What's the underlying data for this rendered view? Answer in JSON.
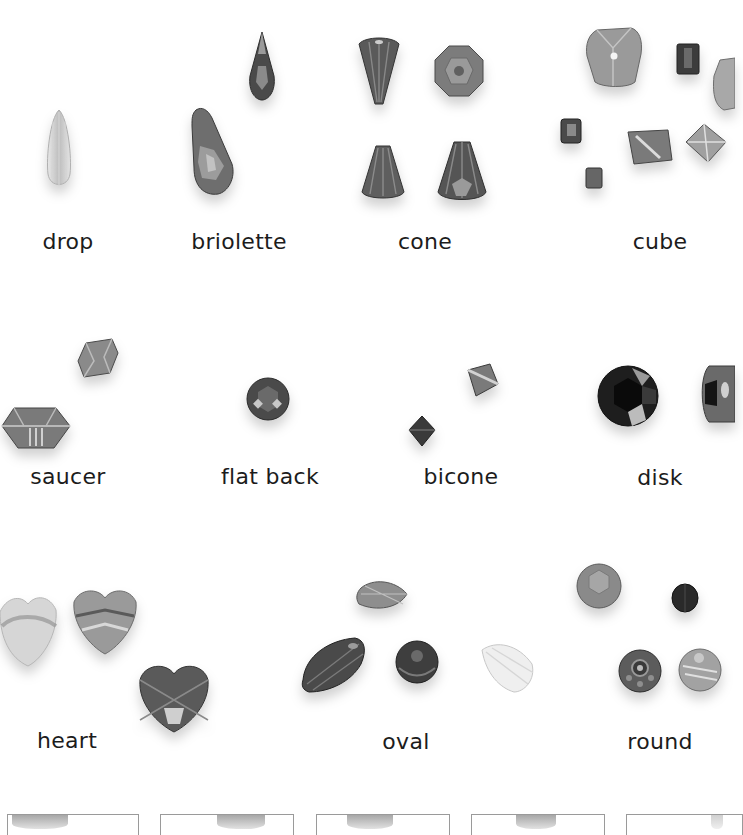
{
  "page": {
    "background": "#ffffff",
    "text_color": "#1c1c1c"
  },
  "shapes": [
    {
      "id": "drop",
      "label": "drop"
    },
    {
      "id": "briolette",
      "label": "briolette"
    },
    {
      "id": "cone",
      "label": "cone"
    },
    {
      "id": "cube",
      "label": "cube"
    },
    {
      "id": "saucer",
      "label": "saucer"
    },
    {
      "id": "flat-back",
      "label": "flat back"
    },
    {
      "id": "bicone",
      "label": "bicone"
    },
    {
      "id": "disk",
      "label": "disk"
    },
    {
      "id": "heart",
      "label": "heart"
    },
    {
      "id": "oval",
      "label": "oval"
    },
    {
      "id": "round",
      "label": "round"
    }
  ],
  "thumbnail_strip": {
    "count": 5
  }
}
